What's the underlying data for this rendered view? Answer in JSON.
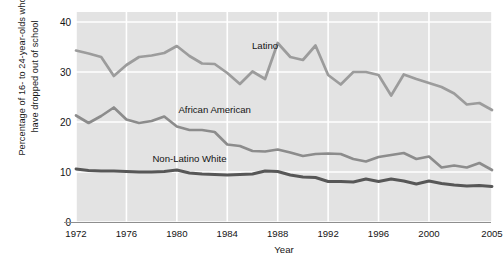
{
  "chart_data": {
    "type": "line",
    "title": "",
    "xlabel": "Year",
    "ylabel": "Percentage of 16- to 24-year-olds who have dropped out of school",
    "ylabel_line1": "Percentage of 16- to 24-year-olds who",
    "ylabel_line2": "have dropped out of school",
    "xlim": [
      1972,
      2005
    ],
    "ylim": [
      0,
      42
    ],
    "yticks": [
      0,
      10,
      20,
      30,
      40
    ],
    "ytick_labels": [
      "0",
      "10",
      "20",
      "30",
      "40"
    ],
    "xticks": [
      1972,
      1976,
      1980,
      1984,
      1988,
      1992,
      1996,
      2000,
      2005
    ],
    "xtick_labels": [
      "1972",
      "1976",
      "1980",
      "1984",
      "1988",
      "1992",
      "1996",
      "2000",
      "2005"
    ],
    "grid": true,
    "grid_color": "#ffffff",
    "plot_background": "#e3e3e3",
    "legend": "inline-labels",
    "x": [
      1972,
      1973,
      1974,
      1975,
      1976,
      1977,
      1978,
      1979,
      1980,
      1981,
      1982,
      1983,
      1984,
      1985,
      1986,
      1987,
      1988,
      1989,
      1990,
      1991,
      1992,
      1993,
      1994,
      1995,
      1996,
      1997,
      1998,
      1999,
      2000,
      2001,
      2002,
      2003,
      2004,
      2005
    ],
    "series": [
      {
        "name": "Latino",
        "color": "#9c9c9c",
        "label_x": 1987,
        "label_y": 35.4,
        "values": [
          34.3,
          33.7,
          33.0,
          29.2,
          31.4,
          33.0,
          33.3,
          33.8,
          35.2,
          33.2,
          31.7,
          31.6,
          29.8,
          27.6,
          30.1,
          28.6,
          35.8,
          33.0,
          32.4,
          35.3,
          29.4,
          27.5,
          30.0,
          30.0,
          29.4,
          25.3,
          29.5,
          28.6,
          27.8,
          27.0,
          25.7,
          23.5,
          23.8,
          22.4
        ]
      },
      {
        "name": "African American",
        "color": "#8c8c8c",
        "label_x": 1983,
        "label_y": 22.6,
        "values": [
          21.3,
          19.8,
          21.2,
          22.9,
          20.5,
          19.8,
          20.2,
          21.1,
          19.1,
          18.4,
          18.4,
          18.0,
          15.5,
          15.2,
          14.2,
          14.1,
          14.5,
          13.9,
          13.2,
          13.6,
          13.7,
          13.6,
          12.6,
          12.1,
          13.0,
          13.4,
          13.8,
          12.6,
          13.1,
          10.9,
          11.3,
          10.9,
          11.8,
          10.4
        ]
      },
      {
        "name": "Non-Latino White",
        "color": "#575757",
        "label_x": 1981,
        "label_y": 12.8,
        "values": [
          10.6,
          10.3,
          10.2,
          10.2,
          10.1,
          10.0,
          10.0,
          10.1,
          10.4,
          9.8,
          9.6,
          9.5,
          9.4,
          9.5,
          9.6,
          10.2,
          10.1,
          9.4,
          9.0,
          8.9,
          8.1,
          8.1,
          8.0,
          8.6,
          8.1,
          8.6,
          8.2,
          7.6,
          8.2,
          7.7,
          7.4,
          7.2,
          7.3,
          7.1
        ]
      }
    ]
  }
}
